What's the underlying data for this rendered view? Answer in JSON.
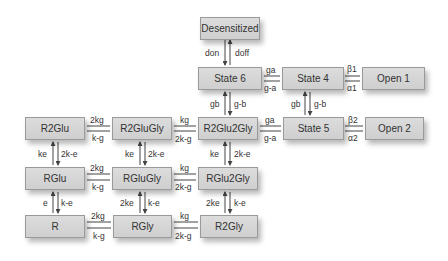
{
  "states": {
    "desensitized": "Desensitized",
    "state6": "State 6",
    "state4": "State 4",
    "open1": "Open 1",
    "state5": "State 5",
    "open2": "Open 2",
    "r2glu": "R2Glu",
    "r2glugly": "R2GluGly",
    "r2glu2gly": "R2Glu2Gly",
    "rglu": "RGlu",
    "rglugly": "RGluGly",
    "rglu2gly": "RGlu2Gly",
    "r": "R",
    "rgly": "RGly",
    "r2gly": "R2Gly"
  },
  "rates": {
    "des_s6_down": "don",
    "des_s6_up": "doff",
    "s6_s4_fwd": "ga",
    "s6_s4_back": "g-a",
    "s4_o1_top": "β1",
    "s4_o1_bottom": "α1",
    "s6_r2g2g_up": "gb",
    "s6_r2g2g_down": "g-b",
    "s4_s5_up": "gb",
    "s4_s5_down": "g-b",
    "r2g2g_s5_fwd": "ga",
    "r2g2g_s5_back": "g-a",
    "s5_o2_top": "β2",
    "s5_o2_bottom": "α2",
    "r2glu_r2glugly_fwd": "2kg",
    "r2glu_r2glugly_back": "k-g",
    "r2glugly_r2glu2gly_fwd": "kg",
    "r2glugly_r2glu2gly_back": "2k-g",
    "r2glu_rglu_up": "ke",
    "r2glu_rglu_down": "2k-e",
    "r2glugly_rglugly_up": "ke",
    "r2glugly_rglugly_down": "2k-e",
    "r2glu2gly_rglu2gly_up": "ke",
    "r2glu2gly_rglu2gly_down": "2k-e",
    "rglu_rglugly_fwd": "2kg",
    "rglu_rglugly_back": "k-g",
    "rglugly_rglu2gly_fwd": "kg",
    "rglugly_rglu2gly_back": "2k-g",
    "rglu_r_up": "e",
    "rglu_r_down": "k-e",
    "rglugly_rgly_up": "2ke",
    "rglugly_rgly_down": "k-e",
    "rglu2gly_r2gly_up": "2ke",
    "rglu2gly_r2gly_down": "k-e",
    "r_rgly_fwd": "2kg",
    "r_rgly_back": "k-g",
    "rgly_r2gly_fwd": "kg",
    "rgly_r2gly_back": "2k-g"
  }
}
